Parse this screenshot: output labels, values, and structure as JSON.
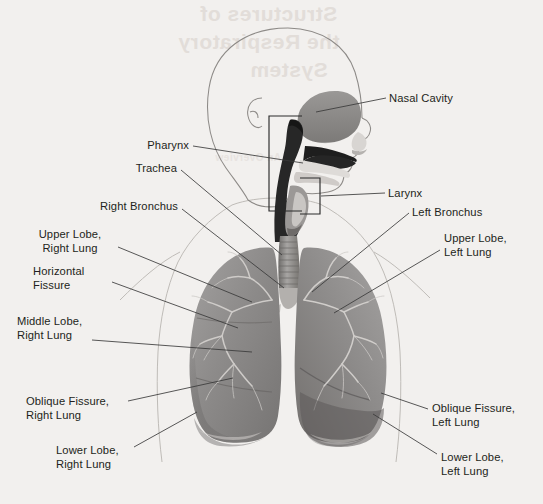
{
  "page": {
    "background_color": "#f2f0ee",
    "ghost_text": [
      {
        "text": "Structures of",
        "x": 200,
        "y": 2,
        "size": 21
      },
      {
        "text": "the Respiratory",
        "x": 178,
        "y": 30,
        "size": 21
      },
      {
        "text": "System",
        "x": 250,
        "y": 58,
        "size": 21
      },
      {
        "text": "An Overview",
        "x": 215,
        "y": 152,
        "size": 10
      }
    ]
  },
  "illustration": {
    "name": "respiratory-system-illustration",
    "description": "Grayscale anatomical drawing: head in profile with nasal cavity, pharynx, larynx, trachea and both lungs with bronchial trees",
    "parts": [
      {
        "id": "nasal-cavity",
        "color": "#8f8d8b"
      },
      {
        "id": "pharynx",
        "color": "#2a2a2a"
      },
      {
        "id": "larynx",
        "color": "#6d6b69"
      },
      {
        "id": "trachea",
        "color": "#8a8785"
      },
      {
        "id": "right-lung",
        "color": "#8e8c8a"
      },
      {
        "id": "left-lung",
        "color": "#8e8c8a"
      },
      {
        "id": "bronchial-tree",
        "color": "#cfcdca"
      },
      {
        "id": "body-outline",
        "color": "#b9b5b1"
      }
    ]
  },
  "labels": [
    {
      "id": "nasal-cavity",
      "text": "Nasal Cavity",
      "align": "left",
      "x": 389,
      "y": 91,
      "leader": "M 370 99 L 382 98",
      "pointer": "M 316 112 L 370 99"
    },
    {
      "id": "pharynx",
      "text": "Pharynx",
      "align": "right",
      "x": 129,
      "y": 138,
      "leader": "M 193 146 L 236 148",
      "pointer": "M 236 148 L 300 163"
    },
    {
      "id": "trachea",
      "text": "Trachea",
      "align": "right",
      "x": 131,
      "y": 161,
      "leader": "M 181 170 L 280 253",
      "pointer": ""
    },
    {
      "id": "right-bronchus",
      "text": "Right Bronchus",
      "align": "right",
      "x": 87,
      "y": 199,
      "leader": "M 182 209 L 282 285",
      "pointer": ""
    },
    {
      "id": "upper-lobe-right-lung",
      "text": "Upper Lobe,\nRight Lung",
      "line1": "Upper Lobe,",
      "line2": "Right Lung",
      "align": "center",
      "x": 33,
      "y": 227,
      "leader": "M 118 247 L 250 302",
      "pointer": ""
    },
    {
      "id": "horizontal-fissure",
      "text": "Horizontal\nFissure",
      "line1": "Horizontal",
      "line2": "Fissure",
      "align": "left",
      "x": 33,
      "y": 264,
      "leader": "M 112 282 L 237 328",
      "pointer": ""
    },
    {
      "id": "middle-lobe-right-lung",
      "text": "Middle Lobe,\nRight Lung",
      "line1": "Middle Lobe,",
      "line2": "Right Lung",
      "align": "left",
      "x": 17,
      "y": 314,
      "leader": "M 90 340 L 250 352",
      "pointer": ""
    },
    {
      "id": "oblique-fissure-right-lung",
      "text": "Oblique Fissure,\nRight Lung",
      "line1": "Oblique Fissure,",
      "line2": "Right Lung",
      "align": "left",
      "x": 26,
      "y": 394,
      "leader": "M 125 402 L 232 378",
      "pointer": ""
    },
    {
      "id": "lower-lobe-right-lung",
      "text": "Lower Lobe,\nRight Lung",
      "line1": "Lower Lobe,",
      "line2": "Right Lung",
      "align": "left",
      "x": 56,
      "y": 443,
      "leader": "M 133 448 L 195 412",
      "pointer": ""
    },
    {
      "id": "larynx",
      "text": "Larynx",
      "align": "left",
      "x": 388,
      "y": 186,
      "leader": "M 368 194 L 382 193",
      "pointer": "M 316 196 L 368 194"
    },
    {
      "id": "left-bronchus",
      "text": "Left Bronchus",
      "align": "left",
      "x": 412,
      "y": 205,
      "leader": "M 312 290 L 408 213",
      "pointer": ""
    },
    {
      "id": "upper-lobe-left-lung",
      "text": "Upper Lobe,\nLeft Lung",
      "line1": "Upper Lobe,",
      "line2": "Left Lung",
      "align": "left",
      "x": 444,
      "y": 231,
      "leader": "M 334 312 L 438 250",
      "pointer": ""
    },
    {
      "id": "oblique-fissure-left-lung",
      "text": "Oblique Fissure,\nLeft Lung",
      "line1": "Oblique Fissure,",
      "line2": "Left Lung",
      "align": "left",
      "x": 432,
      "y": 401,
      "leader": "M 380 393 L 425 410",
      "pointer": ""
    },
    {
      "id": "lower-lobe-left-lung",
      "text": "Lower Lobe,\nLeft Lung",
      "line1": "Lower Lobe,",
      "line2": "Left Lung",
      "align": "left",
      "x": 441,
      "y": 450,
      "leader": "M 372 414 L 432 455",
      "pointer": ""
    }
  ]
}
